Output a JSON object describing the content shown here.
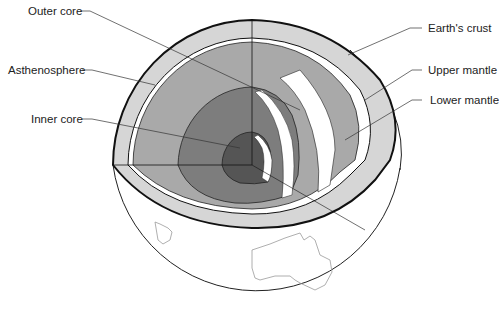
{
  "diagram": {
    "labels": {
      "outer_core": "Outer core",
      "asthenosphere": "Asthenosphere",
      "inner_core": "Inner core",
      "earths_crust": "Earth's crust",
      "upper_mantle": "Upper mantle",
      "lower_mantle": "Lower mantle"
    },
    "colors": {
      "crust": "#d6d6d6",
      "upper_mantle": "#ffffff",
      "asthenosphere": "#a9a9a9",
      "outer_core": "#7d7d7d",
      "inner_core": "#555555",
      "outline": "#111111",
      "continent_outline": "#9a9a9a",
      "leader_line": "#333333"
    },
    "continent": "Australia"
  }
}
